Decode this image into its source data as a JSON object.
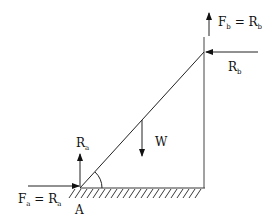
{
  "diagram": {
    "colors": {
      "line": "#222222",
      "background": "#ffffff"
    },
    "labels": {
      "fb": {
        "main": "F",
        "sub": "b",
        "eq": " = R",
        "sub2": "b"
      },
      "rb": {
        "main": "R",
        "sub": "b"
      },
      "ra": {
        "main": "R",
        "sub": "a"
      },
      "w": "W",
      "fa": {
        "main": "F",
        "sub": "a",
        "eq": " = R",
        "sub2": "a"
      },
      "a": "A"
    }
  }
}
